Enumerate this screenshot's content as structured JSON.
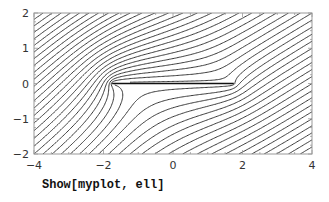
{
  "caption": "Show[myplot, ell]",
  "chart_data": {
    "type": "contour",
    "title": "",
    "xlabel": "",
    "ylabel": "",
    "xlim": [
      -4,
      4
    ],
    "ylim": [
      -2,
      2
    ],
    "x_ticks": [
      "-4",
      "-2",
      "0",
      "2",
      "4"
    ],
    "x_tick_values": [
      -4,
      -2,
      0,
      2,
      4
    ],
    "y_ticks": [
      "-2",
      "-1",
      "0",
      "1",
      "2"
    ],
    "y_tick_values": [
      -2,
      -1,
      0,
      1,
      2
    ],
    "plate": {
      "x_start": -1.75,
      "x_end": 1.75,
      "y": 0
    },
    "flow": {
      "angle_deg": 33,
      "speed": 1,
      "circulation": -2.2
    },
    "grid": false,
    "line_color": "#222222",
    "frame_color": "#999999"
  }
}
